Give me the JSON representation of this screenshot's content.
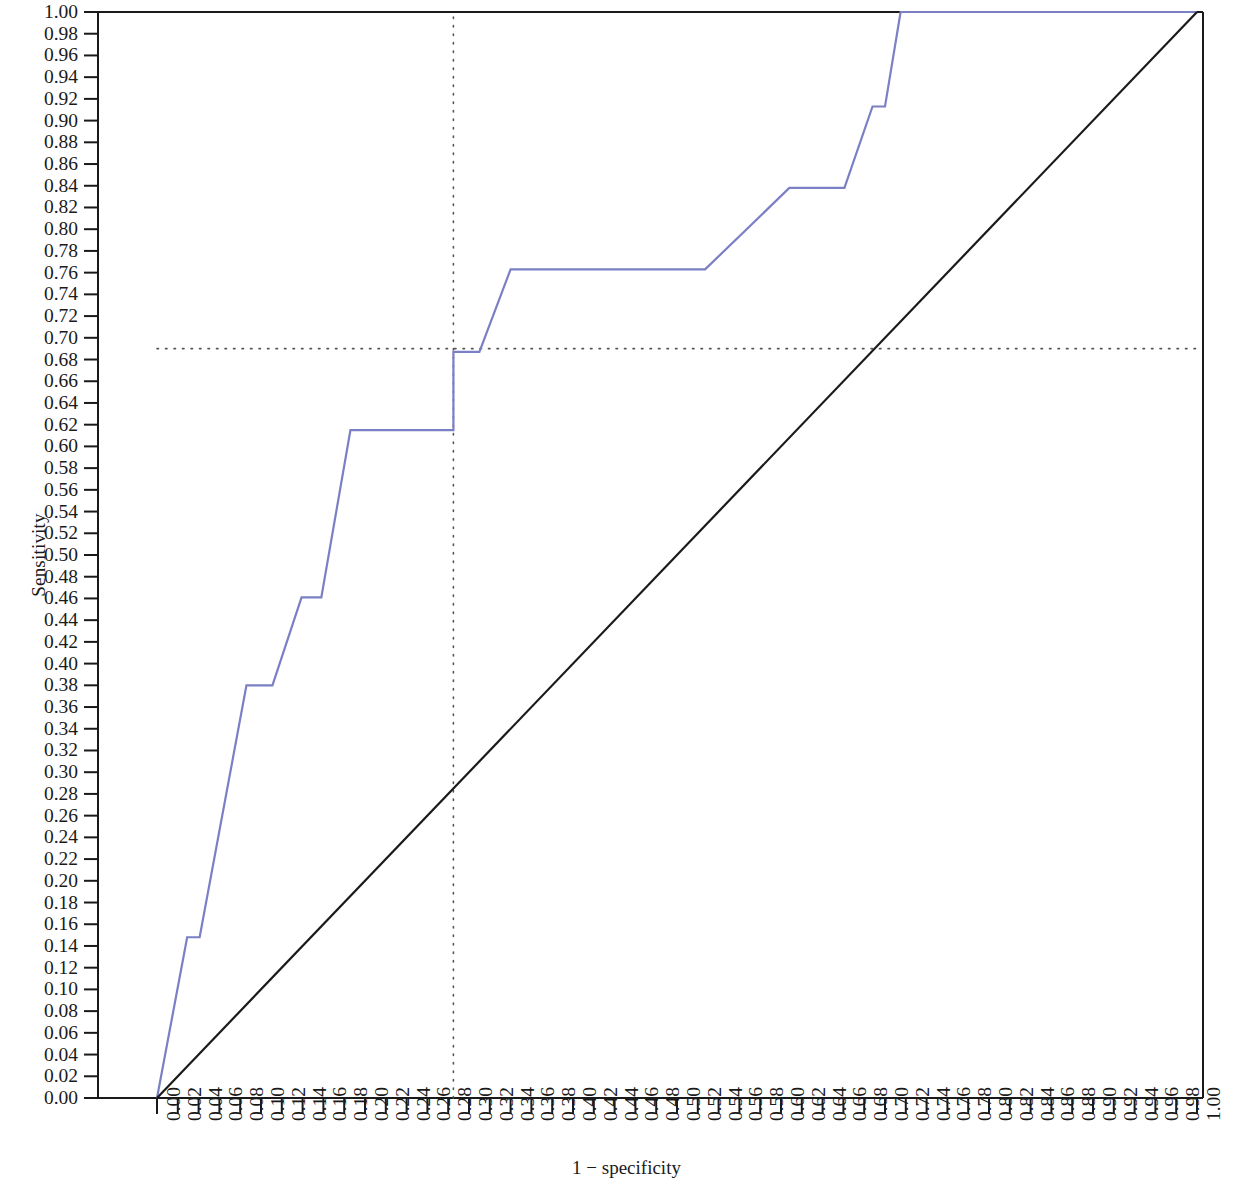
{
  "chart_data": {
    "type": "line",
    "title": "",
    "subtitle": "",
    "xlabel": "1 − specificity",
    "ylabel": "Sensitivity",
    "xlim": [
      0.0,
      1.0
    ],
    "ylim": [
      0.0,
      1.0
    ],
    "grid": false,
    "legend": null,
    "xticks": [
      "0.00",
      "0.02",
      "0.04",
      "0.06",
      "0.08",
      "0.10",
      "0.12",
      "0.14",
      "0.16",
      "0.18",
      "0.20",
      "0.22",
      "0.24",
      "0.26",
      "0.28",
      "0.30",
      "0.32",
      "0.34",
      "0.36",
      "0.38",
      "0.40",
      "0.42",
      "0.44",
      "0.46",
      "0.48",
      "0.50",
      "0.52",
      "0.54",
      "0.56",
      "0.58",
      "0.60",
      "0.62",
      "0.64",
      "0.66",
      "0.68",
      "0.70",
      "0.72",
      "0.74",
      "0.76",
      "0.78",
      "0.80",
      "0.82",
      "0.84",
      "0.86",
      "0.88",
      "0.90",
      "0.92",
      "0.94",
      "0.96",
      "0.98",
      "1.00"
    ],
    "yticks": [
      "1.00",
      "0.98",
      "0.96",
      "0.94",
      "0.92",
      "0.90",
      "0.88",
      "0.86",
      "0.84",
      "0.82",
      "0.80",
      "0.78",
      "0.76",
      "0.74",
      "0.72",
      "0.70",
      "0.68",
      "0.66",
      "0.64",
      "0.62",
      "0.60",
      "0.58",
      "0.56",
      "0.54",
      "0.52",
      "0.50",
      "0.48",
      "0.46",
      "0.44",
      "0.42",
      "0.40",
      "0.38",
      "0.36",
      "0.34",
      "0.32",
      "0.30",
      "0.28",
      "0.26",
      "0.24",
      "0.22",
      "0.20",
      "0.18",
      "0.16",
      "0.14",
      "0.12",
      "0.10",
      "0.08",
      "0.06",
      "0.04",
      "0.02",
      "0.00"
    ],
    "series": [
      {
        "name": "ROC curve",
        "color": "#7b7fc4",
        "type": "step-line",
        "points": [
          [
            0.0,
            0.0
          ],
          [
            0.029,
            0.148
          ],
          [
            0.041,
            0.148
          ],
          [
            0.086,
            0.38
          ],
          [
            0.111,
            0.38
          ],
          [
            0.139,
            0.461
          ],
          [
            0.158,
            0.461
          ],
          [
            0.186,
            0.615
          ],
          [
            0.285,
            0.615
          ],
          [
            0.285,
            0.687
          ],
          [
            0.31,
            0.687
          ],
          [
            0.34,
            0.763
          ],
          [
            0.527,
            0.763
          ],
          [
            0.608,
            0.838
          ],
          [
            0.661,
            0.838
          ],
          [
            0.688,
            0.913
          ],
          [
            0.7,
            0.913
          ],
          [
            0.715,
            1.0
          ],
          [
            1.0,
            1.0
          ]
        ]
      },
      {
        "name": "reference diagonal",
        "color": "#1a1a1a",
        "type": "line",
        "points": [
          [
            0.0,
            0.0
          ],
          [
            1.0,
            1.0
          ]
        ]
      }
    ],
    "annotations": [
      {
        "name": "cutpoint-guide-horizontal",
        "style": "dotted",
        "color": "#555555",
        "orientation": "horizontal",
        "value": 0.69,
        "from": 0.0,
        "to": 1.0
      },
      {
        "name": "cutpoint-guide-vertical",
        "style": "dotted",
        "color": "#555555",
        "orientation": "vertical",
        "value": 0.285,
        "from": 0.0,
        "to": 1.0
      }
    ]
  },
  "axes": {
    "x_title": "1 − specificity",
    "y_title": "Sensitivity"
  }
}
